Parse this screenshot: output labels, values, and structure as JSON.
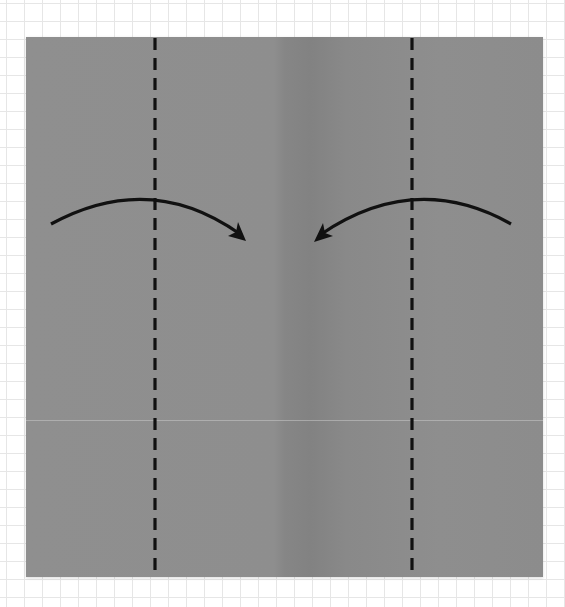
{
  "diagram": {
    "type": "origami-fold-step",
    "paper": {
      "color": "#8e8e8e",
      "center_band_color": "#838383"
    },
    "grid": {
      "line_color": "#e6e6e6",
      "spacing_px": 18
    },
    "fold_lines": [
      {
        "name": "left-valley-fold",
        "style": "dashed",
        "x": 155,
        "color": "#111111"
      },
      {
        "name": "right-valley-fold",
        "style": "dashed",
        "x": 412,
        "color": "#111111"
      }
    ],
    "arrows": [
      {
        "name": "fold-left-flap-inward",
        "direction": "right",
        "start": [
          51,
          224
        ],
        "end": [
          246,
          240
        ]
      },
      {
        "name": "fold-right-flap-inward",
        "direction": "left",
        "start": [
          511,
          224
        ],
        "end": [
          314,
          241
        ]
      }
    ]
  }
}
